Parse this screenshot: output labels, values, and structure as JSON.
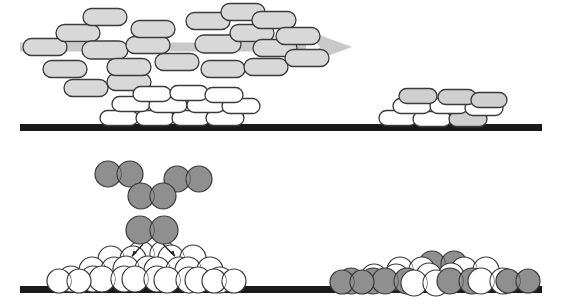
{
  "figure": {
    "width": 562,
    "height": 308,
    "background": "#ffffff",
    "panels": [
      {
        "id": "top-panel",
        "name": "anisotropic-capsule-deposition",
        "description": "Rod/capsule shaped particles in a directional gas flux depositing onto a substrate forming two separated island clusters"
      },
      {
        "id": "bottom-panel",
        "name": "diatomic-molecule-deposition",
        "description": "Dumbbell shaped diatomic molecules impinging on a substrate, forming a tall pyramidal white island at left and a flat mixed white/grey island at right"
      }
    ]
  },
  "colors": {
    "substrate": "#1a1a1a",
    "capsule_gas_fill": "#d8d8d8",
    "capsule_film_fill": "#cfcfcf",
    "particle_white_fill": "#ffffff",
    "particle_grey_fill": "#8f8f8f",
    "outline": "#3a3a3a",
    "outline_dark": "#222222",
    "flux_arrow": "#c9c9c9",
    "leader_line": "#4a4a4a"
  },
  "substrates": [
    {
      "name": "upper-substrate",
      "x": 20,
      "y": 124,
      "width": 522,
      "height": 7
    },
    {
      "name": "lower-substrate",
      "x": 20,
      "y": 286,
      "width": 522,
      "height": 7
    }
  ],
  "flux_arrow": {
    "name": "deposition-flux-arrow",
    "direction": "left-to-right",
    "shaft": {
      "x1": 20,
      "y1": 47,
      "x2": 316,
      "y2": 47,
      "thickness": 9
    },
    "head": {
      "tip_x": 352,
      "tip_y": 47,
      "half_height": 17,
      "back_x": 306
    },
    "color": "#c9c9c9"
  },
  "leader_line": {
    "name": "capsule-to-island-leader",
    "x1": 138,
    "y1": 87,
    "x2": 160,
    "y2": 104,
    "color": "#4a4a4a",
    "width": 1.3
  },
  "gas_capsules": [
    {
      "cx": 45,
      "cy": 47,
      "w": 44,
      "h": 17,
      "rot": 0
    },
    {
      "cx": 65,
      "cy": 69,
      "w": 44,
      "h": 17,
      "rot": 0
    },
    {
      "cx": 78,
      "cy": 33,
      "w": 44,
      "h": 17,
      "rot": 0
    },
    {
      "cx": 105,
      "cy": 17,
      "w": 44,
      "h": 17,
      "rot": 0
    },
    {
      "cx": 105,
      "cy": 50,
      "w": 46,
      "h": 18,
      "rot": 0
    },
    {
      "cx": 86,
      "cy": 88,
      "w": 44,
      "h": 17,
      "rot": 0
    },
    {
      "cx": 129,
      "cy": 82,
      "w": 44,
      "h": 17,
      "rot": 0
    },
    {
      "cx": 129,
      "cy": 67,
      "w": 44,
      "h": 17,
      "rot": 0
    },
    {
      "cx": 148,
      "cy": 45,
      "w": 44,
      "h": 17,
      "rot": 0
    },
    {
      "cx": 153,
      "cy": 29,
      "w": 44,
      "h": 17,
      "rot": 0
    },
    {
      "cx": 177,
      "cy": 62,
      "w": 44,
      "h": 17,
      "rot": 0
    },
    {
      "cx": 208,
      "cy": 21,
      "w": 44,
      "h": 17,
      "rot": 0
    },
    {
      "cx": 218,
      "cy": 44,
      "w": 46,
      "h": 18,
      "rot": 0
    },
    {
      "cx": 223,
      "cy": 69,
      "w": 44,
      "h": 17,
      "rot": 0
    },
    {
      "cx": 243,
      "cy": 12,
      "w": 44,
      "h": 17,
      "rot": 0
    },
    {
      "cx": 252,
      "cy": 33,
      "w": 44,
      "h": 17,
      "rot": 0
    },
    {
      "cx": 274,
      "cy": 20,
      "w": 44,
      "h": 17,
      "rot": 0
    },
    {
      "cx": 275,
      "cy": 48,
      "w": 44,
      "h": 17,
      "rot": 0
    },
    {
      "cx": 266,
      "cy": 67,
      "w": 44,
      "h": 17,
      "rot": 0
    },
    {
      "cx": 298,
      "cy": 36,
      "w": 44,
      "h": 17,
      "rot": 0
    },
    {
      "cx": 307,
      "cy": 58,
      "w": 44,
      "h": 17,
      "rot": 0
    }
  ],
  "island_left_capsules": [
    {
      "cx": 119,
      "cy": 118,
      "w": 38,
      "h": 15,
      "fill": "white"
    },
    {
      "cx": 155,
      "cy": 118,
      "w": 38,
      "h": 15,
      "fill": "white"
    },
    {
      "cx": 191,
      "cy": 118,
      "w": 38,
      "h": 15,
      "fill": "white"
    },
    {
      "cx": 225,
      "cy": 118,
      "w": 38,
      "h": 15,
      "fill": "white"
    },
    {
      "cx": 131,
      "cy": 104,
      "w": 38,
      "h": 15,
      "fill": "white"
    },
    {
      "cx": 168,
      "cy": 105,
      "w": 38,
      "h": 15,
      "fill": "white"
    },
    {
      "cx": 206,
      "cy": 105,
      "w": 38,
      "h": 15,
      "fill": "white"
    },
    {
      "cx": 241,
      "cy": 106,
      "w": 38,
      "h": 15,
      "fill": "white"
    },
    {
      "cx": 152,
      "cy": 94,
      "w": 38,
      "h": 15,
      "fill": "white"
    },
    {
      "cx": 189,
      "cy": 93,
      "w": 38,
      "h": 15,
      "fill": "white"
    },
    {
      "cx": 224,
      "cy": 95,
      "w": 38,
      "h": 15,
      "fill": "white"
    }
  ],
  "island_right_capsules": [
    {
      "cx": 398,
      "cy": 118,
      "w": 38,
      "h": 15,
      "fill": "white"
    },
    {
      "cx": 432,
      "cy": 119,
      "w": 38,
      "h": 15,
      "fill": "white"
    },
    {
      "cx": 468,
      "cy": 119,
      "w": 38,
      "h": 15,
      "fill": "grey"
    },
    {
      "cx": 412,
      "cy": 106,
      "w": 38,
      "h": 15,
      "fill": "white"
    },
    {
      "cx": 449,
      "cy": 106,
      "w": 38,
      "h": 15,
      "fill": "white"
    },
    {
      "cx": 484,
      "cy": 108,
      "w": 38,
      "h": 15,
      "fill": "white"
    },
    {
      "cx": 418,
      "cy": 96,
      "w": 38,
      "h": 15,
      "fill": "grey"
    },
    {
      "cx": 457,
      "cy": 97,
      "w": 38,
      "h": 15,
      "fill": "grey"
    },
    {
      "cx": 489,
      "cy": 100,
      "w": 36,
      "h": 15,
      "fill": "grey"
    }
  ],
  "free_dumbbells": [
    {
      "cx": 119,
      "cy": 174,
      "r": 13,
      "sep": 11,
      "fill": "grey"
    },
    {
      "cx": 188,
      "cy": 179,
      "r": 13,
      "sep": 11,
      "fill": "grey"
    },
    {
      "cx": 152,
      "cy": 196,
      "r": 13,
      "sep": 11,
      "fill": "grey"
    }
  ],
  "landing_dumbbell": {
    "name": "landing-dumbbell",
    "cx": 152,
    "cy": 230,
    "r": 14,
    "sep": 12,
    "fill": "grey"
  },
  "dissociation_arrows": [
    {
      "name": "dissociation-arrow-left",
      "path": "M 143 244 Q 136 252 132 256",
      "tip": [
        132,
        257
      ]
    },
    {
      "name": "dissociation-arrow-right",
      "path": "M 163 244 Q 170 252 175 256",
      "tip": [
        175,
        257
      ]
    }
  ],
  "pile_left_dumbbells": [
    {
      "cx": 152,
      "cy": 254,
      "r": 13,
      "sep": 11,
      "fill": "white"
    },
    {
      "cx": 122,
      "cy": 259,
      "r": 13,
      "sep": 11,
      "fill": "white"
    },
    {
      "cx": 182,
      "cy": 258,
      "r": 13,
      "sep": 11,
      "fill": "white"
    },
    {
      "cx": 103,
      "cy": 270,
      "r": 13,
      "sep": 11,
      "fill": "white"
    },
    {
      "cx": 137,
      "cy": 269,
      "r": 13,
      "sep": 11,
      "fill": "white"
    },
    {
      "cx": 168,
      "cy": 270,
      "r": 13,
      "sep": 11,
      "fill": "white"
    },
    {
      "cx": 199,
      "cy": 270,
      "r": 13,
      "sep": 11,
      "fill": "white"
    },
    {
      "cx": 82,
      "cy": 279,
      "r": 13,
      "sep": 11,
      "fill": "white"
    },
    {
      "cx": 113,
      "cy": 279,
      "r": 13,
      "sep": 11,
      "fill": "white"
    },
    {
      "cx": 146,
      "cy": 279,
      "r": 13,
      "sep": 11,
      "fill": "white"
    },
    {
      "cx": 178,
      "cy": 280,
      "r": 13,
      "sep": 11,
      "fill": "white"
    },
    {
      "cx": 209,
      "cy": 280,
      "r": 13,
      "sep": 11,
      "fill": "white"
    },
    {
      "cx": 69,
      "cy": 281,
      "r": 12,
      "sep": 10,
      "fill": "white"
    },
    {
      "cx": 224,
      "cy": 281,
      "r": 12,
      "sep": 10,
      "fill": "white"
    }
  ],
  "pile_right_dumbbells": [
    {
      "cx": 443,
      "cy": 264,
      "r": 13,
      "sep": 11,
      "fill": "grey"
    },
    {
      "cx": 411,
      "cy": 270,
      "r": 13,
      "sep": 11,
      "fill": "white"
    },
    {
      "cx": 475,
      "cy": 270,
      "r": 13,
      "sep": 11,
      "fill": "white"
    },
    {
      "cx": 385,
      "cy": 277,
      "r": 13,
      "sep": 11,
      "fill": "white"
    },
    {
      "cx": 440,
      "cy": 276,
      "r": 13,
      "sep": 11,
      "fill": "white"
    },
    {
      "cx": 362,
      "cy": 281,
      "r": 13,
      "sep": 11,
      "fill": "grey"
    },
    {
      "cx": 396,
      "cy": 281,
      "r": 13,
      "sep": 11,
      "fill": "grey"
    },
    {
      "cx": 425,
      "cy": 283,
      "r": 13,
      "sep": 11,
      "fill": "white"
    },
    {
      "cx": 461,
      "cy": 281,
      "r": 13,
      "sep": 11,
      "fill": "grey"
    },
    {
      "cx": 492,
      "cy": 281,
      "r": 13,
      "sep": 11,
      "fill": "white"
    },
    {
      "cx": 518,
      "cy": 281,
      "r": 12,
      "sep": 10,
      "fill": "grey"
    },
    {
      "cx": 352,
      "cy": 282,
      "r": 12,
      "sep": 10,
      "fill": "grey"
    }
  ]
}
